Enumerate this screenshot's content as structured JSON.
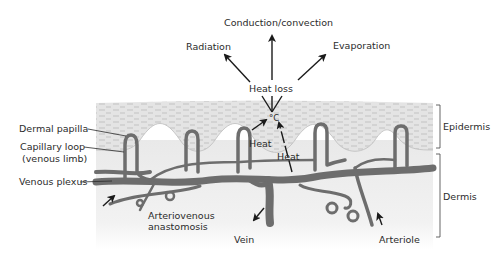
{
  "heat_loss": {
    "center_label": "Heat loss",
    "routes": [
      {
        "label": "Radiation",
        "direction": "up-left"
      },
      {
        "label": "Conduction/convection",
        "direction": "up"
      },
      {
        "label": "Evaporation",
        "direction": "up-right"
      }
    ],
    "temperature_symbol": "°C",
    "heat_labels": [
      "Heat",
      "Heat"
    ]
  },
  "layers": [
    {
      "label": "Epidermis"
    },
    {
      "label": "Dermis"
    }
  ],
  "left_labels": [
    {
      "label": "Dermal papilla"
    },
    {
      "label": "Capillary  loop"
    },
    {
      "label": "(venous limb)"
    },
    {
      "label": "Venous plexus"
    }
  ],
  "bottom_labels": [
    {
      "label": "Arteriovenous"
    },
    {
      "label": "anastomosis"
    },
    {
      "label": "Vein"
    },
    {
      "label": "Arteriole"
    }
  ],
  "colors": {
    "epidermis_fill": "#e6e6e6",
    "dermis_fill": "#ededed",
    "vessel": "#6d6d6d",
    "arrow": "#1a1a1a",
    "text": "#2b2b2b"
  }
}
